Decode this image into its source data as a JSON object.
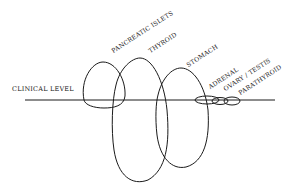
{
  "diagram": {
    "baseline_label": "CLINICAL LEVEL",
    "loops": [
      {
        "id": "pancreatic-islets",
        "label": "PANCREATIC ISLETS"
      },
      {
        "id": "thyroid",
        "label": "THYROID"
      },
      {
        "id": "stomach",
        "label": "STOMACH"
      },
      {
        "id": "adrenal",
        "label": "ADRENAL"
      },
      {
        "id": "ovary-testis",
        "label": "OVARY / TESTIS"
      },
      {
        "id": "parathyroid",
        "label": "PARATHYROID"
      }
    ],
    "colors": {
      "line": "#1a1a1a",
      "background": "#ffffff"
    }
  }
}
